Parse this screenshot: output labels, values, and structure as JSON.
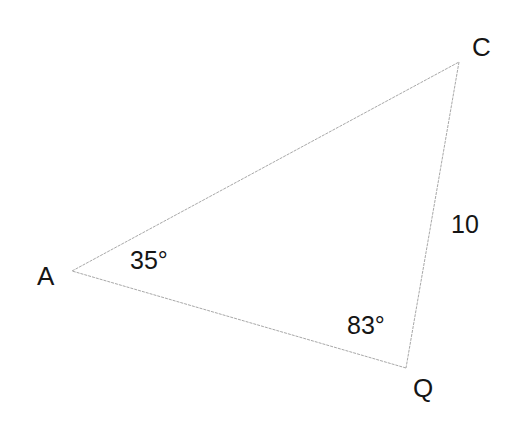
{
  "diagram": {
    "type": "triangle",
    "line_color": "#a8a8a8",
    "text_color": "#151515",
    "vertices": [
      {
        "name": "A",
        "x": 72,
        "y": 271
      },
      {
        "name": "C",
        "x": 459,
        "y": 62
      },
      {
        "name": "Q",
        "x": 406,
        "y": 368
      }
    ],
    "vertex_labels": {
      "A": "A",
      "C": "C",
      "Q": "Q"
    },
    "angles": {
      "A": "35°",
      "Q": "83°"
    },
    "sides": {
      "CQ": "10"
    }
  }
}
